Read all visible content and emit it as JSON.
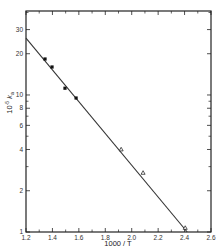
{
  "chart_data": {
    "type": "scatter",
    "title": "",
    "xlabel": "1000 / T",
    "ylabel": "10⁻⁵ kₐ",
    "ylabel_parts": {
      "prefix": "10",
      "exp": "-5",
      "symbol": "k",
      "sub": "a"
    },
    "xscale": "linear",
    "yscale": "log",
    "xlim": [
      1.2,
      2.6
    ],
    "ylim": [
      1,
      41
    ],
    "grid": false,
    "legend": null,
    "x_ticks": [
      1.2,
      1.4,
      1.6,
      1.8,
      2.0,
      2.2,
      2.4,
      2.6
    ],
    "x_tick_labels": [
      "1.2",
      "1.4",
      "1.6",
      "1.8",
      "2.0",
      "2.2",
      "2.4",
      "2.6"
    ],
    "x_minor_ticks": [
      1.3,
      1.5,
      1.7,
      1.9,
      2.1,
      2.3,
      2.5
    ],
    "y_ticks": [
      1,
      2,
      4,
      6,
      8,
      10,
      20,
      30
    ],
    "y_tick_labels": [
      "1",
      "2",
      "4",
      "6",
      "8",
      "10",
      "20",
      "30"
    ],
    "y_minor_ticks": [
      3,
      5,
      7,
      9,
      40
    ],
    "series": [
      {
        "name": "filled points",
        "marker": "filled-square",
        "x": [
          1.344,
          1.397,
          1.495,
          1.579
        ],
        "y": [
          18.3,
          16.0,
          11.2,
          9.5
        ]
      },
      {
        "name": "open points",
        "marker": "open-triangle",
        "x": [
          1.92,
          2.086,
          2.405
        ],
        "y": [
          4.0,
          2.7,
          1.07
        ]
      }
    ],
    "fit_line": {
      "x": [
        1.2,
        2.42
      ],
      "y": [
        26,
        1.0
      ]
    }
  },
  "labels": {
    "x_title": "1000 / T",
    "y_prefix": "10",
    "y_exp": "-5",
    "y_symbol": "k",
    "y_sub": "a"
  },
  "colors": {
    "axis": "#222222",
    "line": "#333333",
    "marker": "#111111"
  }
}
